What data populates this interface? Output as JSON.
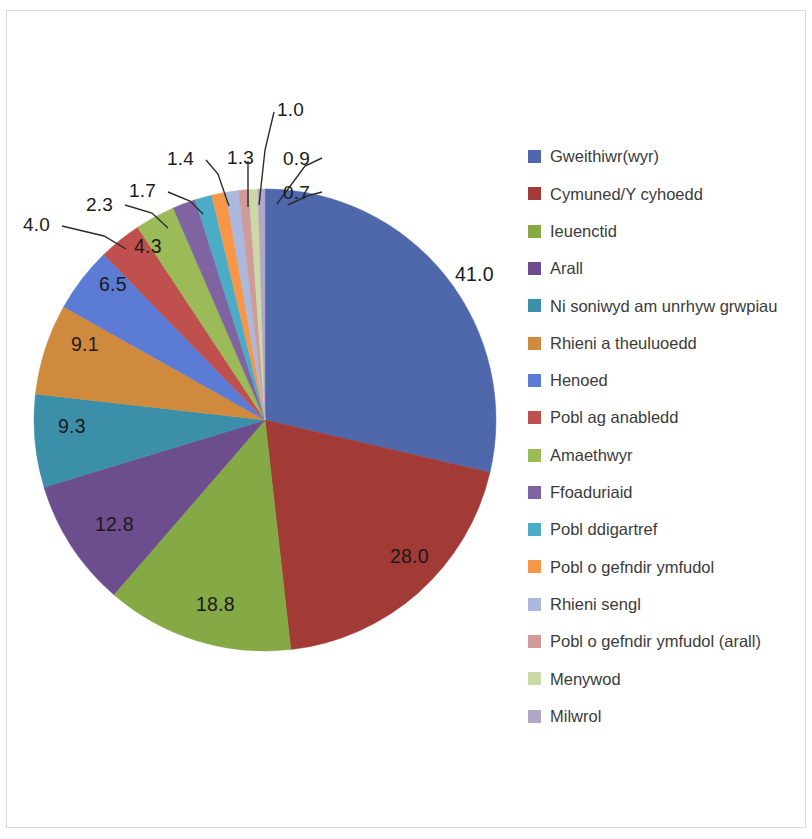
{
  "chart_data": {
    "type": "pie",
    "title": "",
    "subtitle": "",
    "xlabel": "",
    "ylabel": "",
    "grid": false,
    "legend_position": "right",
    "units": "percent",
    "start_angle_deg": 0,
    "direction": "clockwise",
    "categories": [
      "Gweithiwr(wyr)",
      "Cymuned/Y cyhoedd",
      "Ieuenctid",
      "Arall",
      "Ni soniwyd am unrhyw grwpiau",
      "Rhieni a theuluoedd",
      "Henoed",
      "Pobl ag anabledd",
      "Amaethwyr",
      "Ffoaduriaid",
      "Pobl ddigartref",
      "Pobl o gefndir ymfudol",
      "Rhieni sengl",
      "Pobl o gefndir ymfudol (arall)",
      "Menywod",
      "Milwrol"
    ],
    "values": [
      41.0,
      28.0,
      18.8,
      12.8,
      9.3,
      9.1,
      6.5,
      4.3,
      4.0,
      2.3,
      1.7,
      1.4,
      1.3,
      1.0,
      0.9,
      0.7
    ],
    "colors": [
      "#4f67ab",
      "#a23a36",
      "#85a944",
      "#6c4e8e",
      "#3c8fa8",
      "#d08a3e",
      "#5b7bd5",
      "#c0504d",
      "#9bbb59",
      "#8064a2",
      "#4bacc6",
      "#f79646",
      "#aab9dd",
      "#cf9a97",
      "#cbdaa4",
      "#b3a7c8"
    ],
    "label_placement": [
      "inside",
      "inside",
      "inside",
      "inside",
      "inside",
      "inside",
      "inside",
      "inside",
      "callout",
      "callout",
      "callout",
      "callout",
      "callout",
      "callout",
      "callout",
      "callout"
    ]
  },
  "legend": {
    "items": [
      {
        "label": "Gweithiwr(wyr)",
        "color": "#4f67ab"
      },
      {
        "label": "Cymuned/Y cyhoedd",
        "color": "#a23a36"
      },
      {
        "label": "Ieuenctid",
        "color": "#85a944"
      },
      {
        "label": "Arall",
        "color": "#6c4e8e"
      },
      {
        "label": "Ni soniwyd am unrhyw grwpiau",
        "color": "#3c8fa8"
      },
      {
        "label": "Rhieni a theuluoedd",
        "color": "#d08a3e"
      },
      {
        "label": "Henoed",
        "color": "#5b7bd5"
      },
      {
        "label": "Pobl ag anabledd",
        "color": "#c0504d"
      },
      {
        "label": "Amaethwyr",
        "color": "#9bbb59"
      },
      {
        "label": "Ffoaduriaid",
        "color": "#8064a2"
      },
      {
        "label": "Pobl ddigartref",
        "color": "#4bacc6"
      },
      {
        "label": "Pobl o gefndir ymfudol",
        "color": "#f79646"
      },
      {
        "label": "Rhieni sengl",
        "color": "#aab9dd"
      },
      {
        "label": "Pobl o gefndir ymfudol (arall)",
        "color": "#cf9a97"
      },
      {
        "label": "Menywod",
        "color": "#cbdaa4"
      },
      {
        "label": "Milwrol",
        "color": "#b3a7c8"
      }
    ]
  },
  "data_labels": [
    {
      "text": "41.0",
      "x": 455,
      "y": 263,
      "kind": "inside"
    },
    {
      "text": "28.0",
      "x": 390,
      "y": 545,
      "kind": "inside"
    },
    {
      "text": "18.8",
      "x": 196,
      "y": 593,
      "kind": "inside"
    },
    {
      "text": "12.8",
      "x": 95,
      "y": 513,
      "kind": "inside"
    },
    {
      "text": "9.3",
      "x": 58,
      "y": 415,
      "kind": "inside"
    },
    {
      "text": "9.1",
      "x": 71,
      "y": 333,
      "kind": "inside"
    },
    {
      "text": "6.5",
      "x": 99,
      "y": 273,
      "kind": "inside"
    },
    {
      "text": "4.3",
      "x": 134,
      "y": 235,
      "kind": "inside"
    },
    {
      "text": "4.0",
      "x": 23,
      "y": 214,
      "kind": "callout"
    },
    {
      "text": "2.3",
      "x": 86,
      "y": 194,
      "kind": "callout"
    },
    {
      "text": "1.7",
      "x": 129,
      "y": 180,
      "kind": "callout"
    },
    {
      "text": "1.4",
      "x": 167,
      "y": 148,
      "kind": "callout"
    },
    {
      "text": "1.3",
      "x": 227,
      "y": 147,
      "kind": "callout"
    },
    {
      "text": "1.0",
      "x": 277,
      "y": 99,
      "kind": "callout"
    },
    {
      "text": "0.9",
      "x": 283,
      "y": 148,
      "kind": "callout"
    },
    {
      "text": "0.7",
      "x": 283,
      "y": 182,
      "kind": "callout"
    }
  ],
  "leader_lines": [
    {
      "points": "62,226 104,236 126,249"
    },
    {
      "points": "125,205 152,213 168,228"
    },
    {
      "points": "168,192 190,201 203,214"
    },
    {
      "points": "206,160 218,174 229,206"
    },
    {
      "points": "248,161 248,207"
    },
    {
      "points": "274,112 265,150 259,205"
    },
    {
      "points": "322,158 305,166 277,204"
    },
    {
      "points": "322,192 307,196 288,205"
    }
  ]
}
